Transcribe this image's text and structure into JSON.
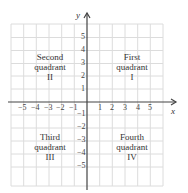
{
  "axes": {
    "x_label": "x",
    "y_label": "y"
  },
  "x_ticks": [
    "−5",
    "−4",
    "−3",
    "−2",
    "−1",
    "1",
    "2",
    "3",
    "4",
    "5"
  ],
  "y_ticks_pos": [
    "5",
    "4",
    "3",
    "2",
    "1"
  ],
  "y_ticks_neg": [
    "−1",
    "−2",
    "−3",
    "−4",
    "−5"
  ],
  "quadrants": {
    "q1": {
      "line1": "First",
      "line2": "quadrant",
      "numeral": "I"
    },
    "q2": {
      "line1": "Second",
      "line2": "quadrant",
      "numeral": "II"
    },
    "q3": {
      "line1": "Third",
      "line2": "quadrant",
      "numeral": "III"
    },
    "q4": {
      "line1": "Fourth",
      "line2": "quadrant",
      "numeral": "IV"
    }
  },
  "colors": {
    "grid": "#dcdcdc",
    "axis": "#444444"
  }
}
